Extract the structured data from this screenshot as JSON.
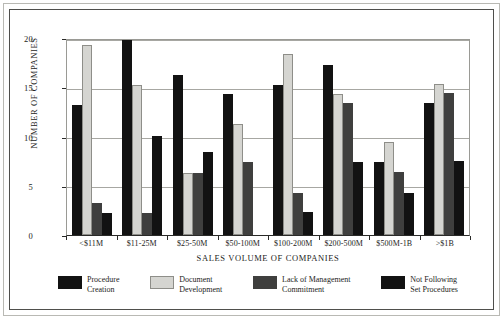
{
  "chart_data": {
    "type": "bar",
    "title": "",
    "xlabel": "SALES VOLUME OF COMPANIES",
    "ylabel": "NUMBER OF COMPANIES",
    "ylim": [
      0,
      20
    ],
    "yticks": [
      0,
      5,
      10,
      15,
      20
    ],
    "grid": true,
    "legend_position": "bottom",
    "categories": [
      "<$11M",
      "$11-25M",
      "$25-50M",
      "$50-100M",
      "$100-200M",
      "$200-500M",
      "$500M-1B",
      ">$1B"
    ],
    "series": [
      {
        "name": "Procedure Creation",
        "color": "#121212",
        "values": [
          13.2,
          20.5,
          16.2,
          14.3,
          15.2,
          17.3,
          7.4,
          13.4
        ]
      },
      {
        "name": "Document Development",
        "color": "#d5d5d1",
        "values": [
          19.3,
          15.2,
          6.3,
          11.3,
          18.4,
          14.3,
          9.4,
          15.3
        ]
      },
      {
        "name": "Lack of Management Commitment",
        "color": "#3f3f3e",
        "values": [
          3.2,
          2.2,
          6.3,
          7.4,
          4.3,
          13.4,
          6.4,
          14.4
        ]
      },
      {
        "name": "Not Following Set Procedures",
        "color": "#121212",
        "values": [
          2.2,
          10.1,
          8.4,
          0,
          2.3,
          7.4,
          4.3,
          7.5
        ]
      }
    ],
    "legend": [
      {
        "line1": "Procedure",
        "line2": "Creation"
      },
      {
        "line1": "Document",
        "line2": "Development"
      },
      {
        "line1": "Lack of Management",
        "line2": "Commitment"
      },
      {
        "line1": "Not Following",
        "line2": "Set Procedures"
      }
    ]
  }
}
